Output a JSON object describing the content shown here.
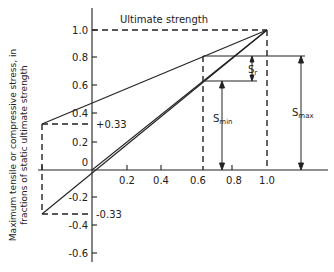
{
  "diagram": {
    "type": "modified Goodman diagram",
    "y_axis_label_line1": "Maximum tensile or compressive stress, in",
    "y_axis_label_line2": "fractions of static ultimate strength",
    "y_ticks": [
      "1.0",
      "0.8",
      "0.6",
      "0.4",
      "0.2",
      "0",
      "-0.2",
      "-0.4",
      "-0.6"
    ],
    "x_ticks": [
      "0.2",
      "0.4",
      "0.6",
      "0.8",
      "1.0"
    ],
    "annotations": {
      "ultimate_strength": "Ultimate strength",
      "plus_033": "+0.33",
      "minus_033": "-0.33",
      "s_r": "S",
      "s_r_sub": "r",
      "s_min": "S",
      "s_min_sub": "min",
      "s_max": "S",
      "s_max_sub": "max"
    }
  }
}
